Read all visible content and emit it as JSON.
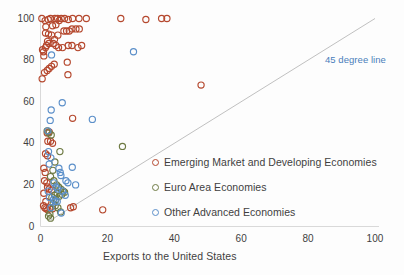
{
  "chart_data": {
    "type": "scatter",
    "title": "",
    "xlabel": "Exports to the United States",
    "ylabel": "",
    "xlim": [
      0,
      100
    ],
    "ylim": [
      0,
      100
    ],
    "xticks": [
      "0",
      "20",
      "40",
      "60",
      "80",
      "100"
    ],
    "yticks": [
      "0",
      "20",
      "40",
      "60",
      "80",
      "100"
    ],
    "grid": false,
    "legend_position": "inside-right-lower",
    "annotations": [
      {
        "text": "45 degree line",
        "x": 78,
        "y": 83,
        "color": "#4a7ebb"
      }
    ],
    "reference_line": {
      "name": "45 degree line",
      "from": [
        3,
        3
      ],
      "to": [
        100,
        100
      ],
      "color": "#b9b9b9"
    },
    "series": [
      {
        "name": "Emerging Market and Developing Economies",
        "color": "#b5482e",
        "marker": "open-circle",
        "points": [
          [
            0.4,
            100
          ],
          [
            1.4,
            99
          ],
          [
            1.6,
            96
          ],
          [
            2.3,
            99.5
          ],
          [
            3.0,
            100
          ],
          [
            3.6,
            96.5
          ],
          [
            4.3,
            100
          ],
          [
            4.6,
            97
          ],
          [
            5.1,
            100
          ],
          [
            5.6,
            99
          ],
          [
            6.2,
            100
          ],
          [
            7.2,
            100
          ],
          [
            8.3,
            99.5
          ],
          [
            9.6,
            100
          ],
          [
            11.5,
            100
          ],
          [
            13.7,
            100
          ],
          [
            24.0,
            100
          ],
          [
            31.5,
            99.5
          ],
          [
            36.2,
            100
          ],
          [
            37.8,
            100
          ],
          [
            1.5,
            93
          ],
          [
            2.4,
            92.5
          ],
          [
            3.3,
            92
          ],
          [
            4.2,
            90
          ],
          [
            5.2,
            92
          ],
          [
            7.0,
            94
          ],
          [
            7.8,
            94
          ],
          [
            8.6,
            94
          ],
          [
            9.4,
            95
          ],
          [
            10.6,
            95
          ],
          [
            11.6,
            95
          ],
          [
            0.6,
            85
          ],
          [
            0.9,
            84
          ],
          [
            1.0,
            82
          ],
          [
            1.5,
            86
          ],
          [
            1.8,
            87
          ],
          [
            2.1,
            89
          ],
          [
            2.5,
            88
          ],
          [
            3.8,
            88
          ],
          [
            4.6,
            87
          ],
          [
            5.4,
            86
          ],
          [
            6.6,
            86
          ],
          [
            8.3,
            87
          ],
          [
            9.4,
            87
          ],
          [
            11.2,
            86
          ],
          [
            12.3,
            87
          ],
          [
            0.5,
            71
          ],
          [
            1.2,
            74
          ],
          [
            2.0,
            75
          ],
          [
            2.6,
            76
          ],
          [
            3.3,
            77
          ],
          [
            4.1,
            78
          ],
          [
            8.0,
            79
          ],
          [
            8.2,
            73
          ],
          [
            9.6,
            52
          ],
          [
            48.0,
            68
          ],
          [
            2.0,
            45
          ],
          [
            2.6,
            45.5
          ],
          [
            2.2,
            41
          ],
          [
            3.0,
            41
          ],
          [
            3.6,
            40
          ],
          [
            1.5,
            35
          ],
          [
            2.1,
            34
          ],
          [
            1.0,
            28
          ],
          [
            1.4,
            26
          ],
          [
            1.2,
            22
          ],
          [
            1.9,
            21
          ],
          [
            2.1,
            19
          ],
          [
            2.6,
            18
          ],
          [
            3.3,
            17.5
          ],
          [
            1.0,
            16
          ],
          [
            1.6,
            12
          ],
          [
            0.9,
            10
          ],
          [
            1.3,
            9
          ],
          [
            1.7,
            8.5
          ],
          [
            2.2,
            8
          ],
          [
            2.8,
            9
          ],
          [
            3.6,
            8.5
          ],
          [
            9.0,
            9
          ],
          [
            9.8,
            9.5
          ],
          [
            18.6,
            8
          ]
        ]
      },
      {
        "name": "Euro Area Economies",
        "color": "#6e7a43",
        "marker": "open-circle",
        "points": [
          [
            2.0,
            46
          ],
          [
            2.5,
            45
          ],
          [
            3.2,
            44
          ],
          [
            5.8,
            36
          ],
          [
            4.3,
            31
          ],
          [
            3.7,
            27
          ],
          [
            3.0,
            24
          ],
          [
            4.0,
            22
          ],
          [
            4.8,
            20
          ],
          [
            5.4,
            19
          ],
          [
            6.1,
            18
          ],
          [
            6.8,
            17
          ],
          [
            5.0,
            16
          ],
          [
            4.2,
            15
          ],
          [
            3.4,
            14
          ],
          [
            4.6,
            13
          ],
          [
            5.6,
            14.5
          ],
          [
            6.4,
            15.5
          ],
          [
            7.2,
            16.5
          ],
          [
            3.8,
            11
          ],
          [
            4.4,
            10
          ],
          [
            5.2,
            9
          ],
          [
            6.0,
            7
          ],
          [
            2.4,
            5
          ],
          [
            3.0,
            4
          ],
          [
            2.8,
            6
          ],
          [
            24.5,
            38.5
          ]
        ]
      },
      {
        "name": "Other Advanced Economies",
        "color": "#5b8fc9",
        "marker": "open-circle",
        "points": [
          [
            3.3,
            82.5
          ],
          [
            27.8,
            84
          ],
          [
            3.2,
            56
          ],
          [
            6.5,
            59.5
          ],
          [
            2.9,
            51
          ],
          [
            15.5,
            51.5
          ],
          [
            2.2,
            46
          ],
          [
            2.4,
            36
          ],
          [
            3.1,
            33
          ],
          [
            2.6,
            30
          ],
          [
            5.5,
            28
          ],
          [
            5.9,
            26
          ],
          [
            6.1,
            24.5
          ],
          [
            9.5,
            28.5
          ],
          [
            7.6,
            22
          ],
          [
            8.2,
            21
          ],
          [
            10.5,
            20
          ],
          [
            4.0,
            21
          ],
          [
            4.6,
            19
          ],
          [
            5.2,
            18
          ],
          [
            6.6,
            17
          ],
          [
            7.4,
            15
          ],
          [
            3.9,
            13
          ],
          [
            4.4,
            12
          ],
          [
            3.1,
            9
          ],
          [
            6.2,
            6.5
          ],
          [
            2.3,
            17
          ],
          [
            2.7,
            14
          ],
          [
            5.0,
            12
          ]
        ]
      }
    ]
  },
  "axis": {
    "x_title": "Exports to the United States",
    "x_ticks": [
      {
        "label": "0",
        "value": 0
      },
      {
        "label": "20",
        "value": 20
      },
      {
        "label": "40",
        "value": 40
      },
      {
        "label": "60",
        "value": 60
      },
      {
        "label": "80",
        "value": 80
      },
      {
        "label": "100",
        "value": 100
      }
    ],
    "y_ticks": [
      {
        "label": "0",
        "value": 0
      },
      {
        "label": "20",
        "value": 20
      },
      {
        "label": "40",
        "value": 40
      },
      {
        "label": "60",
        "value": 60
      },
      {
        "label": "80",
        "value": 80
      },
      {
        "label": "100",
        "value": 100
      }
    ]
  },
  "legend": {
    "items": [
      {
        "label": "Emerging Market and Developing Economies",
        "color": "#b5482e"
      },
      {
        "label": "Euro Area Economies",
        "color": "#6e7a43"
      },
      {
        "label": "Other Advanced Economies",
        "color": "#5b8fc9"
      }
    ]
  },
  "annotation": {
    "label": "45 degree line",
    "color": "#4a7ebb"
  },
  "colors": {
    "emerging": "#b5482e",
    "euro": "#6e7a43",
    "other_advanced": "#5b8fc9",
    "reference_line": "#bfbfbf",
    "axis": "#d9d9d9",
    "text": "#3f3f3f"
  }
}
